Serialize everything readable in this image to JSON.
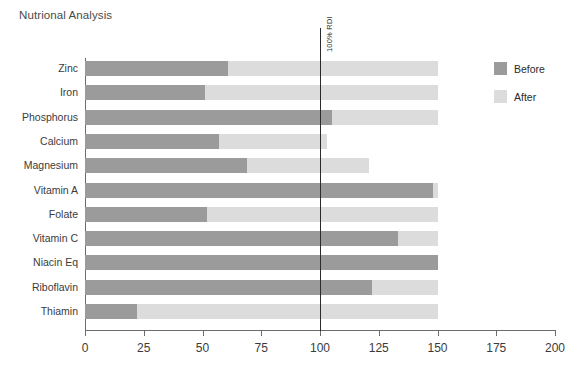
{
  "chart_data": {
    "type": "bar",
    "orientation": "horizontal",
    "title": "Nutrional Analysis",
    "xlabel": "",
    "ylabel": "",
    "xlim": [
      0,
      200
    ],
    "xticks": [
      0,
      25,
      50,
      75,
      100,
      125,
      150,
      175,
      200
    ],
    "grid": false,
    "legend_position": "right",
    "categories": [
      "Zinc",
      "Iron",
      "Phosphorus",
      "Calcium",
      "Magnesium",
      "Vitamin A",
      "Folate",
      "Vitamin C",
      "Niacin Eq",
      "Riboflavin",
      "Thiamin"
    ],
    "series": [
      {
        "name": "Before",
        "color": "#9b9b9b",
        "values": [
          61,
          51,
          105,
          57,
          69,
          148,
          52,
          133,
          150,
          122,
          22
        ]
      },
      {
        "name": "After",
        "color": "#dcdcdc",
        "values": [
          150,
          150,
          150,
          103,
          121,
          150,
          150,
          150,
          150,
          150,
          150
        ]
      }
    ],
    "annotations": [
      {
        "name": "rdi-reference-line",
        "label": "100% RDI",
        "x": 100,
        "color": "#2b2b2b"
      }
    ]
  },
  "legend": {
    "items": [
      {
        "label": "Before",
        "color": "#9b9b9b"
      },
      {
        "label": "After",
        "color": "#dcdcdc"
      }
    ]
  }
}
